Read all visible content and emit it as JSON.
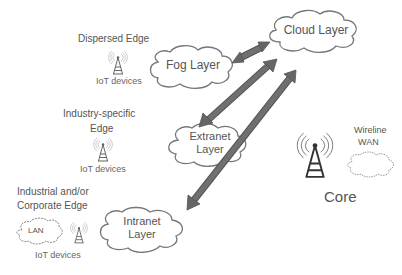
{
  "diagram": {
    "type": "edge-fog-cloud architecture",
    "nodes": {
      "cloud_layer": {
        "label": "Cloud Layer"
      },
      "fog_layer": {
        "label": "Fog Layer"
      },
      "extranet_layer": {
        "label_line1": "Extranet",
        "label_line2": "Layer"
      },
      "intranet_layer": {
        "label_line1": "Intranet",
        "label_line2": "Layer"
      },
      "lan": {
        "label": "LAN"
      },
      "wireline_wan": {
        "label_line1": "Wireline",
        "label_line2": "WAN"
      },
      "core": {
        "label": "Core"
      }
    },
    "edges_groups": {
      "dispersed": {
        "label": "Dispersed Edge",
        "devices": "IoT devices"
      },
      "industry": {
        "label_line1": "Industry-specific",
        "label_line2": "Edge",
        "devices": "IoT devices"
      },
      "industrial": {
        "label_line1": "Industrial and/or",
        "label_line2": "Corporate Edge",
        "devices": "IoT devices"
      }
    },
    "connections": [
      {
        "from": "Fog Layer",
        "to": "Cloud Layer",
        "style": "bidirectional"
      },
      {
        "from": "Cloud Layer",
        "to": "Extranet Layer",
        "style": "bidirectional"
      },
      {
        "from": "Cloud Layer",
        "to": "Intranet Layer",
        "style": "bidirectional"
      }
    ],
    "colors": {
      "arrow": "#6b6b6b",
      "arrow_outline": "#555555",
      "cloud_stroke": "#777777",
      "text": "#555555"
    }
  }
}
